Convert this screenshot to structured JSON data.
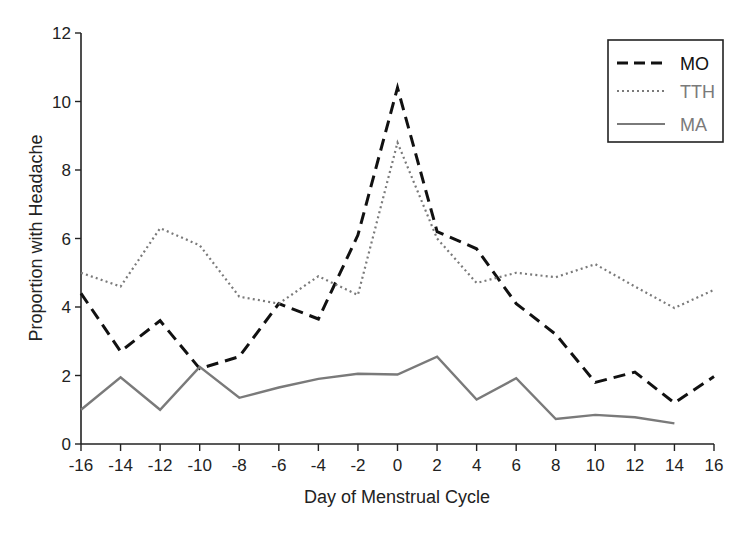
{
  "chart_data": {
    "type": "line",
    "title": "",
    "xlabel": "Day of Menstrual Cycle",
    "ylabel": "Proportion with Headache",
    "x": [
      -16,
      -14,
      -12,
      -10,
      -8,
      -6,
      -4,
      -2,
      0,
      2,
      4,
      6,
      8,
      10,
      12,
      14,
      16
    ],
    "xticks": [
      "-16",
      "-14",
      "-12",
      "-10",
      "-8",
      "-6",
      "-4",
      "-2",
      "0",
      "2",
      "4",
      "6",
      "8",
      "10",
      "12",
      "14",
      "16"
    ],
    "yticks": [
      "0",
      "2",
      "4",
      "6",
      "8",
      "10",
      "12"
    ],
    "xlim": [
      -16,
      16
    ],
    "ylim": [
      0,
      12
    ],
    "grid": false,
    "legend_position": "upper right",
    "series": [
      {
        "name": "MO",
        "style": "dashed",
        "color": "#111111",
        "values": [
          4.4,
          2.7,
          3.6,
          2.2,
          2.55,
          4.1,
          3.65,
          6.1,
          10.4,
          6.2,
          5.7,
          4.1,
          3.2,
          1.8,
          2.1,
          1.2,
          1.97
        ]
      },
      {
        "name": "TTH",
        "style": "dotted",
        "color": "#7a7a7a",
        "values": [
          5.0,
          4.6,
          6.3,
          5.8,
          4.3,
          4.1,
          4.9,
          4.35,
          8.8,
          6.0,
          4.7,
          5.0,
          4.87,
          5.25,
          4.6,
          3.97,
          4.5
        ]
      },
      {
        "name": "MA",
        "style": "solid",
        "color": "#7a7a7a",
        "values": [
          1.0,
          1.95,
          1.0,
          2.25,
          1.35,
          1.65,
          1.9,
          2.05,
          2.03,
          2.55,
          1.3,
          1.92,
          0.73,
          0.85,
          0.78,
          0.6,
          null
        ]
      }
    ]
  },
  "legend": {
    "items": [
      {
        "label": "MO",
        "color": "#111111"
      },
      {
        "label": "TTH",
        "color": "#7a7a7a"
      },
      {
        "label": "MA",
        "color": "#7a7a7a"
      }
    ]
  }
}
